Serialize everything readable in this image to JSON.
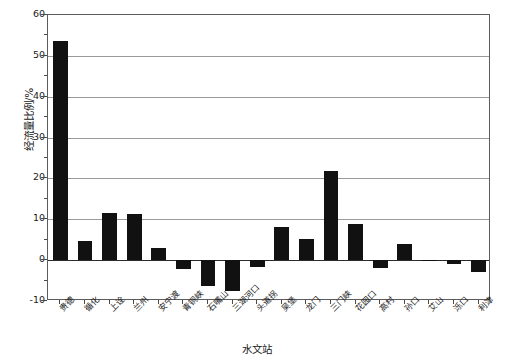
{
  "chart_data": {
    "type": "bar",
    "title": "",
    "xlabel": "水文站",
    "ylabel": "经流量比例/%",
    "ylim": [
      -10,
      60
    ],
    "yticks": [
      60,
      50,
      40,
      30,
      20,
      10,
      0,
      -10
    ],
    "ytick_labels": [
      "60",
      "50",
      "40",
      "30",
      "20",
      "10",
      "0",
      "-10"
    ],
    "grid": true,
    "legend": "none",
    "categories": [
      "贵德",
      "循化",
      "上诠",
      "兰州",
      "安宁渡",
      "青铜峡",
      "石嘴山",
      "三湖河口",
      "头道拐",
      "吴堡",
      "龙门",
      "三门峡",
      "花园口",
      "高村",
      "孙口",
      "艾山",
      "泺口",
      "利津"
    ],
    "values": [
      53.6,
      4.6,
      11.6,
      11.3,
      3.0,
      -2.2,
      -6.4,
      -7.5,
      -1.8,
      8.0,
      5.2,
      21.8,
      8.8,
      -2.0,
      4.0,
      -0.2,
      -1.0,
      -3.0
    ],
    "bar_color": "#111111",
    "axis_color": "#5c5c5c",
    "grid_color": "#9a9a9a"
  }
}
